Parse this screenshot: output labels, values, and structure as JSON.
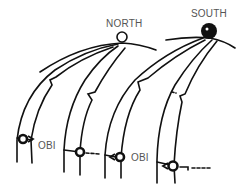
{
  "diagram": {
    "labels": {
      "north": "NORTH",
      "south": "SOUTH",
      "obi_1": "OBI",
      "obi_2": "OBI"
    },
    "colors": {
      "stroke": "#111111",
      "label": "#555555",
      "background": "#ffffff"
    },
    "poles": [
      {
        "name": "NORTH",
        "style": "open-circle"
      },
      {
        "name": "SOUTH",
        "style": "filled-circle"
      }
    ],
    "pairs": 4
  }
}
